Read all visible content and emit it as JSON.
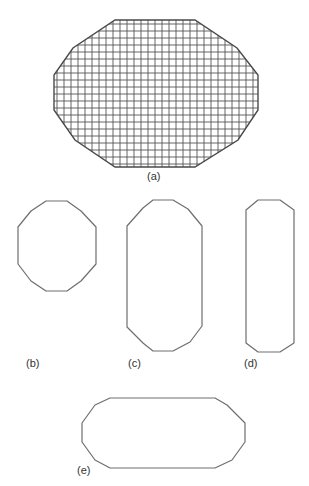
{
  "figure": {
    "panels": [
      {
        "id": "a",
        "label": "(a)",
        "description": "Elongated octagon (12-sided polygon) filled with a square grid",
        "grid": {
          "spacing_px": 7
        },
        "vertices": [
          [
            115,
            20
          ],
          [
            195,
            20
          ],
          [
            237,
            48
          ],
          [
            258,
            75
          ],
          [
            258,
            110
          ],
          [
            238,
            140
          ],
          [
            195,
            167
          ],
          [
            115,
            167
          ],
          [
            75,
            140
          ],
          [
            54,
            110
          ],
          [
            54,
            75
          ],
          [
            73,
            48
          ]
        ],
        "label_pos": [
          147,
          171
        ]
      },
      {
        "id": "b",
        "label": "(b)",
        "description": "Near-regular 12-sided polygon",
        "vertices": [
          [
            46,
            201
          ],
          [
            67,
            201
          ],
          [
            81,
            211
          ],
          [
            96,
            227
          ],
          [
            96,
            264
          ],
          [
            81,
            281
          ],
          [
            67,
            291
          ],
          [
            46,
            291
          ],
          [
            31,
            281
          ],
          [
            18,
            264
          ],
          [
            18,
            227
          ],
          [
            31,
            211
          ]
        ],
        "label_pos": [
          26,
          358
        ]
      },
      {
        "id": "c",
        "label": "(c)",
        "description": "Vertically elongated 12-sided polygon",
        "vertices": [
          [
            153,
            200
          ],
          [
            173,
            200
          ],
          [
            188,
            209
          ],
          [
            202,
            226
          ],
          [
            202,
            326
          ],
          [
            190,
            342
          ],
          [
            173,
            351
          ],
          [
            153,
            351
          ],
          [
            143,
            343
          ],
          [
            127,
            327
          ],
          [
            127,
            226
          ],
          [
            143,
            208
          ]
        ],
        "label_pos": [
          128,
          358
        ]
      },
      {
        "id": "d",
        "label": "(d)",
        "description": "Narrow vertically elongated octagon",
        "vertices": [
          [
            258,
            200
          ],
          [
            280,
            200
          ],
          [
            294,
            210
          ],
          [
            294,
            343
          ],
          [
            280,
            352
          ],
          [
            258,
            352
          ],
          [
            246,
            343
          ],
          [
            246,
            210
          ]
        ],
        "label_pos": [
          244,
          358
        ]
      },
      {
        "id": "e",
        "label": "(e)",
        "description": "Horizontally elongated 12-sided polygon",
        "vertices": [
          [
            110,
            398
          ],
          [
            215,
            398
          ],
          [
            227,
            405
          ],
          [
            245,
            423
          ],
          [
            245,
            442
          ],
          [
            232,
            460
          ],
          [
            215,
            468
          ],
          [
            110,
            468
          ],
          [
            95,
            460
          ],
          [
            82,
            442
          ],
          [
            82,
            423
          ],
          [
            95,
            405
          ]
        ],
        "label_pos": [
          77,
          465
        ]
      }
    ]
  }
}
